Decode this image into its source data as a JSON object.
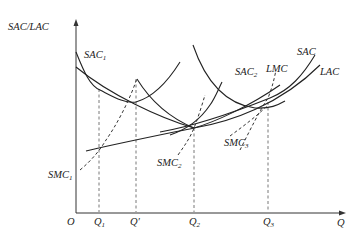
{
  "axes": {
    "y_label": "SAC/LAC",
    "x_label": "Q",
    "origin_label": "O"
  },
  "x_ticks": {
    "q1": {
      "main": "Q",
      "sub": "1"
    },
    "qprime": {
      "main": "Q′"
    },
    "q2": {
      "main": "Q",
      "sub": "2"
    },
    "q3": {
      "main": "Q",
      "sub": "3"
    }
  },
  "curve_labels": {
    "sac1": {
      "main": "SAC",
      "sub": "1"
    },
    "sac2": {
      "main": "SAC",
      "sub": "2"
    },
    "sac": {
      "main": "SAC"
    },
    "lac": {
      "main": "LAC"
    },
    "lmc": {
      "main": "LMC"
    },
    "smc1": {
      "main": "SMC",
      "sub": "1"
    },
    "smc2": {
      "main": "SMC",
      "sub": "2"
    },
    "smc3": {
      "main": "SMC",
      "sub": "3"
    }
  }
}
